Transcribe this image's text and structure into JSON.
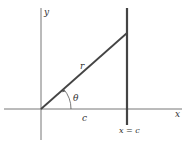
{
  "diagram": {
    "labels": {
      "y_axis": "y",
      "x_axis": "x",
      "radius": "r",
      "angle": "θ",
      "base": "c",
      "vertical_line": "x = c"
    },
    "colors": {
      "axis": "#555555",
      "line": "#444444",
      "text": "#333333"
    }
  }
}
